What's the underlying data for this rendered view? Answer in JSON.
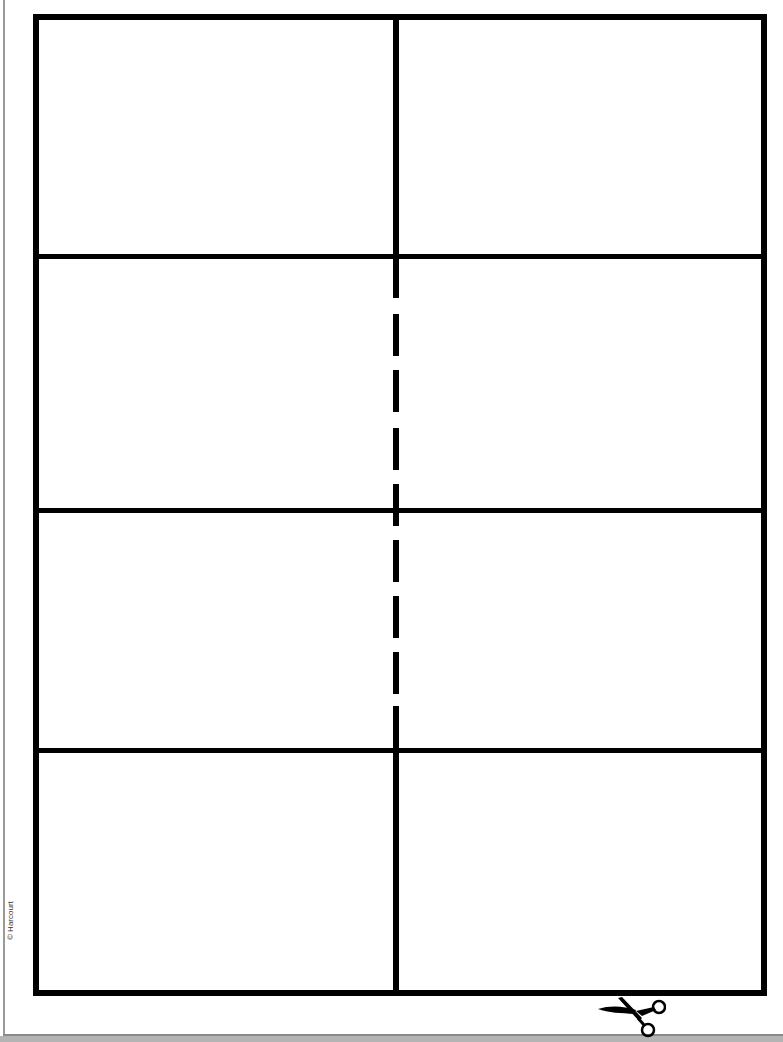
{
  "document": {
    "type": "cut-out card template",
    "grid": {
      "rows": 4,
      "columns": 2
    },
    "copyright": "© Harcourt",
    "cut_marker_icon": "scissors-icon",
    "colors": {
      "line": "#000000",
      "background": "#ffffff",
      "page_edge": "#9a9a9a"
    }
  },
  "cells": [
    {
      "row": 1,
      "col": 1,
      "text": ""
    },
    {
      "row": 1,
      "col": 2,
      "text": ""
    },
    {
      "row": 2,
      "col": 1,
      "text": ""
    },
    {
      "row": 2,
      "col": 2,
      "text": ""
    },
    {
      "row": 3,
      "col": 1,
      "text": ""
    },
    {
      "row": 3,
      "col": 2,
      "text": ""
    },
    {
      "row": 4,
      "col": 1,
      "text": ""
    },
    {
      "row": 4,
      "col": 2,
      "text": ""
    }
  ]
}
